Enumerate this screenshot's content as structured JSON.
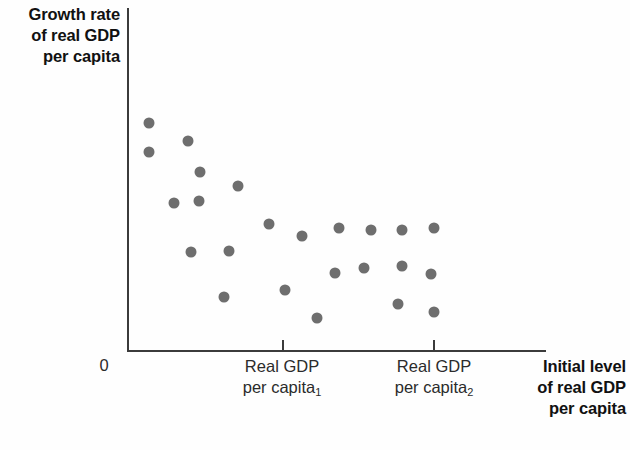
{
  "axes": {
    "y_title": "Growth rate\nof real GDP\nper capita",
    "y_title_lines": [
      "Growth rate",
      "of real GDP",
      "per capita"
    ],
    "origin_label": "0",
    "x_title_lines": [
      "Initial level",
      "of real GDP",
      "per capita"
    ],
    "x_tick_1": {
      "line1": "Real GDP",
      "line2": "per capita",
      "subscript": "1"
    },
    "x_tick_2": {
      "line1": "Real GDP",
      "line2": "per capita",
      "subscript": "2"
    }
  },
  "colors": {
    "axis": "#3b3b3b",
    "dot": "#6e6e6e",
    "text": "#2b2b2b",
    "bold_text": "#111111",
    "background": "#fefefe"
  },
  "chart_data": {
    "type": "scatter",
    "title": "",
    "xlabel": "Initial level of real GDP per capita",
    "ylabel": "Growth rate of real GDP per capita",
    "grid": false,
    "legend": null,
    "xlim": [
      0,
      100
    ],
    "ylim": [
      0,
      100
    ],
    "xticks": [
      {
        "value": 37.2,
        "label": "Real GDP per capita₁"
      },
      {
        "value": 73.0,
        "label": "Real GDP per capita₂"
      }
    ],
    "yticks": [],
    "annotations": [
      {
        "text": "0",
        "position": "origin"
      }
    ],
    "relationship": "negative (convergence: higher initial real GDP per capita associated with lower growth rate)",
    "series": [
      {
        "name": "countries",
        "marker": "circle",
        "color": "#6e6e6e",
        "points": [
          {
            "x": 5.3,
            "y": 66.4
          },
          {
            "x": 5.3,
            "y": 57.9
          },
          {
            "x": 14.6,
            "y": 61.3
          },
          {
            "x": 11.3,
            "y": 43.0
          },
          {
            "x": 17.5,
            "y": 52.1
          },
          {
            "x": 17.3,
            "y": 43.5
          },
          {
            "x": 26.5,
            "y": 48.0
          },
          {
            "x": 15.3,
            "y": 29.3
          },
          {
            "x": 24.4,
            "y": 29.6
          },
          {
            "x": 34.0,
            "y": 37.5
          },
          {
            "x": 22.9,
            "y": 15.5
          },
          {
            "x": 41.7,
            "y": 33.9
          },
          {
            "x": 37.7,
            "y": 18.0
          },
          {
            "x": 49.6,
            "y": 23.0
          },
          {
            "x": 50.6,
            "y": 36.2
          },
          {
            "x": 45.3,
            "y": 11.1
          },
          {
            "x": 58.2,
            "y": 33.6
          },
          {
            "x": 56.6,
            "y": 22.6
          },
          {
            "x": 65.7,
            "y": 33.6
          },
          {
            "x": 65.7,
            "y": 23.0
          },
          {
            "x": 64.7,
            "y": 11.8
          },
          {
            "x": 73.3,
            "y": 34.2
          },
          {
            "x": 72.6,
            "y": 20.5
          },
          {
            "x": 73.3,
            "y": 9.2
          }
        ]
      }
    ],
    "pixel_points": [
      {
        "x": 149,
        "y": 123
      },
      {
        "x": 149,
        "y": 152
      },
      {
        "x": 188,
        "y": 141
      },
      {
        "x": 174,
        "y": 203
      },
      {
        "x": 200,
        "y": 172
      },
      {
        "x": 199,
        "y": 201
      },
      {
        "x": 238,
        "y": 186
      },
      {
        "x": 191,
        "y": 252
      },
      {
        "x": 229,
        "y": 251
      },
      {
        "x": 269,
        "y": 224
      },
      {
        "x": 224,
        "y": 297
      },
      {
        "x": 302,
        "y": 236
      },
      {
        "x": 285,
        "y": 290
      },
      {
        "x": 335,
        "y": 273
      },
      {
        "x": 339,
        "y": 228
      },
      {
        "x": 317,
        "y": 318
      },
      {
        "x": 371,
        "y": 230
      },
      {
        "x": 364,
        "y": 268
      },
      {
        "x": 402,
        "y": 230
      },
      {
        "x": 402,
        "y": 266
      },
      {
        "x": 398,
        "y": 304
      },
      {
        "x": 434,
        "y": 228
      },
      {
        "x": 431,
        "y": 274
      },
      {
        "x": 434,
        "y": 312
      }
    ]
  }
}
